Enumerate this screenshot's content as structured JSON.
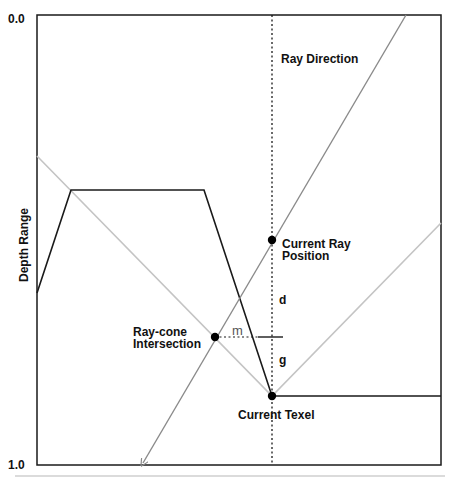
{
  "axis": {
    "top_label": "0.0",
    "bottom_label": "1.0",
    "y_title": "Depth Range"
  },
  "labels": {
    "ray_direction": "Ray Direction",
    "current_ray_position_line1": "Current Ray",
    "current_ray_position_line2": "Position",
    "ray_cone_line1": "Ray-cone",
    "ray_cone_line2": "Intersection",
    "current_texel": "Current Texel",
    "d": "d",
    "g": "g",
    "m": "m"
  },
  "colors": {
    "frame": "#1a1a1a",
    "heightfield": "#1a1a1a",
    "ray": "#8a8a8a",
    "cone": "#c4c4c4",
    "dashed": "#1a1a1a",
    "point": "#000000",
    "separator": "#cfcfcf"
  }
}
